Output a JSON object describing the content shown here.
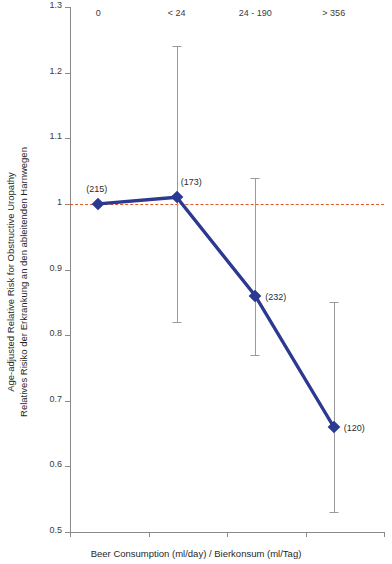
{
  "chart_data": {
    "type": "line",
    "title": "",
    "subtitle": "",
    "xlabel": "Beer Consumption (ml/day) / Bierkonsum (ml/Tag)",
    "ylabel": "Age-adjusted Relative Risk for Obstructive Uropathy\nRelatives Risiko der Erkrankung an den ableitenden Harnwegen",
    "ylabel_line1": "Age-adjusted Relative Risk for Obstructive Uropathy",
    "ylabel_line2": "Relatives Risiko der Erkrankung an den ableitenden Harnwegen",
    "categories": [
      "0",
      "< 24",
      "24 - 190",
      "> 356"
    ],
    "values": [
      1.0,
      1.01,
      0.86,
      0.66
    ],
    "error_low": [
      null,
      0.82,
      0.77,
      0.53
    ],
    "error_high": [
      null,
      1.24,
      1.04,
      0.85
    ],
    "point_labels": [
      "(215)",
      "(173)",
      "(232)",
      "(120)"
    ],
    "counts": [
      215,
      173,
      232,
      120
    ],
    "ylim": [
      0.5,
      1.3
    ],
    "yticks": [
      0.5,
      0.6,
      0.7,
      0.8,
      0.9,
      1.0,
      1.1,
      1.2,
      1.3
    ],
    "ytick_labels": [
      "0.5",
      "0.6",
      "0.7",
      "0.8",
      "0.9",
      "1",
      "1.1",
      "1.2",
      "1.3"
    ],
    "reference_line": {
      "value": 1.0,
      "style": "dashed",
      "color": "#e05a28"
    },
    "grid": false,
    "legend": null,
    "series_color": "#2b3990",
    "errorbar_color": "#9a9a9a",
    "axis_color": "#8a8a8a",
    "marker": "diamond"
  }
}
